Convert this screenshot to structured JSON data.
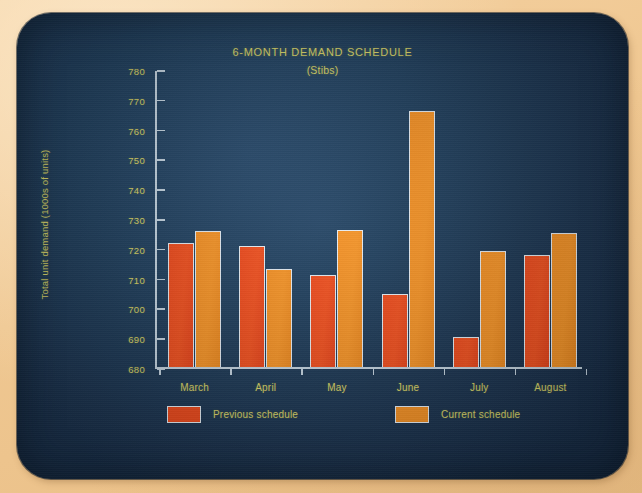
{
  "chart_data": {
    "type": "bar",
    "title": "6-MONTH DEMAND SCHEDULE",
    "subtitle": "(Stibs)",
    "xlabel": "",
    "ylabel": "Total unit demand (1000s of units)",
    "categories": [
      "March",
      "April",
      "May",
      "June",
      "July",
      "August"
    ],
    "series": [
      {
        "name": "Previous schedule",
        "color": "#ef4a1c",
        "values": [
          721.5,
          720.5,
          711,
          704.5,
          690,
          717.5
        ]
      },
      {
        "name": "Current schedule",
        "color": "#f59124",
        "values": [
          725.5,
          713,
          726,
          766,
          719,
          725
        ]
      }
    ],
    "ylim": [
      680,
      780
    ],
    "ytick_step": 10,
    "yticks": [
      680,
      690,
      700,
      710,
      720,
      730,
      740,
      750,
      760,
      770,
      780
    ],
    "grid": false,
    "legend_position": "bottom"
  },
  "colors": {
    "screen_background": "#1b3450",
    "paper_background": "#f2cb9a",
    "text_yellow": "#d9d468",
    "axis": "#c6d6e2",
    "series_previous": "#ef4a1c",
    "series_current": "#f59124"
  }
}
